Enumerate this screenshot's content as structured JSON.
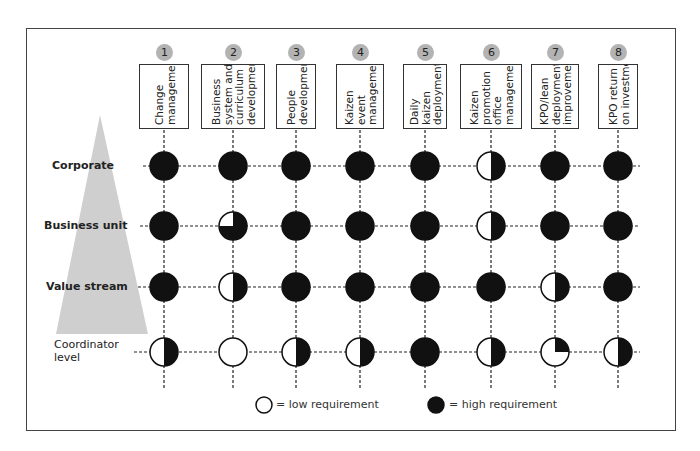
{
  "diagram": {
    "columns": [
      {
        "num": "1",
        "label": "Change\nmanagement"
      },
      {
        "num": "2",
        "label": "Business\nsystem and\ncurriculum\ndevelopment"
      },
      {
        "num": "3",
        "label": "People\ndevelopment"
      },
      {
        "num": "4",
        "label": "Kaizen\nevent\nmanagement"
      },
      {
        "num": "5",
        "label": "Daily\nkaizen\ndeployment"
      },
      {
        "num": "6",
        "label": "Kaizen\npromotion\noffice\nmanagement"
      },
      {
        "num": "7",
        "label": "KPO/lean\ndeployment\nimprovement"
      },
      {
        "num": "8",
        "label": "KPO return\non investment"
      }
    ],
    "rows": [
      {
        "label": "Corporate",
        "levels": [
          "full",
          "full",
          "full",
          "full",
          "full",
          "half",
          "full",
          "full"
        ]
      },
      {
        "label": "Business unit",
        "levels": [
          "full",
          "three-quarter",
          "full",
          "full",
          "full",
          "half",
          "full",
          "full"
        ]
      },
      {
        "label": "Value stream",
        "levels": [
          "full",
          "half",
          "full",
          "full",
          "full",
          "full",
          "half",
          "full"
        ]
      },
      {
        "label": "Coordinator\nlevel",
        "levels": [
          "half",
          "empty",
          "half",
          "half",
          "full",
          "half",
          "quarter",
          "half"
        ]
      }
    ],
    "legend": {
      "low": "= low requirement",
      "high": "= high requirement"
    },
    "colors": {
      "fill": "#111111",
      "badge": "#b3b3b3",
      "pyramid": "#cfcfcf",
      "frame": "#444444"
    }
  }
}
